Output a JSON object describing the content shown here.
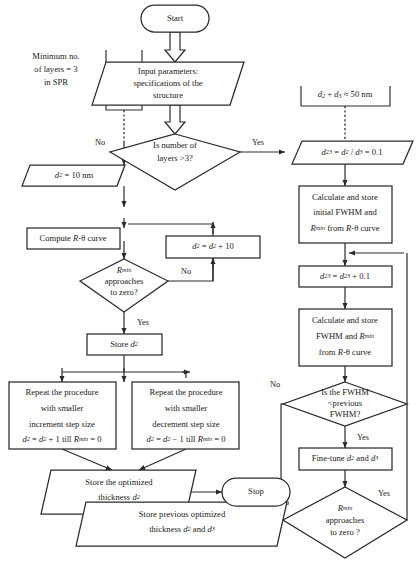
{
  "diagram": {
    "colors": {
      "stroke": "#2b2b2b",
      "fill": "#ffffff",
      "text": "#1a1a1a"
    },
    "canvas": {
      "width": 417,
      "height": 570
    }
  },
  "nodes": {
    "start": {
      "label": "Start",
      "shape": "terminator"
    },
    "input_params": {
      "line1": "Input parameters:",
      "line2": "specifications of the",
      "line3": "structure",
      "shape": "parallelogram"
    },
    "note_min_layers": {
      "line1": "Minimum no.",
      "line2": "of layers = 3",
      "line3": "in SPR",
      "shape": "annotation"
    },
    "decision_layers": {
      "line1": "Is number of",
      "line2": "layers >3?",
      "shape": "diamond"
    },
    "note_sum": {
      "line1": "d2 + d3 ≈ 50 nm",
      "shape": "annotation"
    },
    "d23_init": {
      "label": "d23 = d2 / d3 = 0.1",
      "shape": "parallelogram"
    },
    "calc_initial": {
      "line1": "Calculate and store",
      "line2": "initial FWHM and",
      "line3": "Rmin from R-θ curve",
      "shape": "rect"
    },
    "d23_incr": {
      "label": "d23 = d23 + 0.1",
      "shape": "rect"
    },
    "calc_fwhm": {
      "line1": "Calculate and store",
      "line2": "FWHM and Rmin",
      "line3": "from R-θ curve",
      "shape": "rect"
    },
    "decision_fwhm": {
      "line1": "Is the FWHM",
      "line2": "<previous",
      "line3": "FWHM?",
      "shape": "diamond"
    },
    "fine_tune": {
      "label": "Fine-tune d2 and d3",
      "shape": "rect"
    },
    "decision_rmin_right": {
      "line1": "Rmin",
      "line2": "approaches",
      "line3": "to zero ?",
      "shape": "diamond"
    },
    "d2_init": {
      "label": "d2 = 10 nm",
      "shape": "parallelogram"
    },
    "compute_curve": {
      "label": "Compute R-θ curve",
      "shape": "rect"
    },
    "d2_incr": {
      "label": "d2 = d2 + 10",
      "shape": "rect"
    },
    "decision_rmin_left": {
      "line1": "Rmin",
      "line2": "approaches",
      "line3": "to zero?",
      "shape": "diamond"
    },
    "store_d2": {
      "label": "Store d2",
      "shape": "rect"
    },
    "repeat_incr": {
      "line1": "Repeat the procedure",
      "line2": "with smaller",
      "line3": "increment step size",
      "line4": "d2 = d2 + 1 till Rmin = 0",
      "shape": "rect"
    },
    "repeat_decr": {
      "line1": "Repeat the procedure",
      "line2": "with smaller",
      "line3": "decrement step size",
      "line4": "d2 = d2 − 1 till Rmin = 0",
      "shape": "rect"
    },
    "store_optimized": {
      "line1": "Store the optimized",
      "line2": "thickness d2",
      "shape": "parallelogram"
    },
    "store_prev_optimized": {
      "line1": "Store previous optimized",
      "line2": "thickness d2 and d3",
      "shape": "parallelogram"
    },
    "stop": {
      "label": "Stop",
      "shape": "terminator"
    }
  },
  "edge_labels": {
    "no_layers": "No",
    "yes_layers": "Yes",
    "no_rmin_left": "No",
    "yes_rmin_left": "Yes",
    "no_fwhm": "No",
    "yes_fwhm": "Yes",
    "yes_rmin_right": "Yes",
    "no_rmin_right": "No"
  }
}
